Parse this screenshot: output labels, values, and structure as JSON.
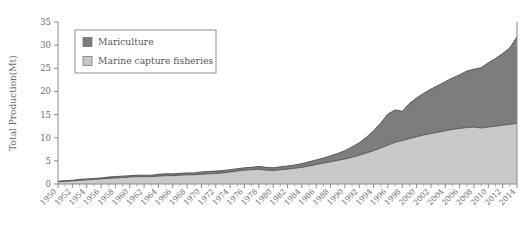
{
  "chart_data": {
    "type": "area",
    "stacked": true,
    "title": "",
    "xlabel": "",
    "ylabel": "Total Production(Mt)",
    "ylim": [
      0,
      35
    ],
    "yticks": [
      0,
      5,
      10,
      15,
      20,
      25,
      30,
      35
    ],
    "xlim": [
      1950,
      2014
    ],
    "grid": false,
    "legend_position": "upper-left",
    "x": [
      1950,
      1951,
      1952,
      1953,
      1954,
      1955,
      1956,
      1957,
      1958,
      1959,
      1960,
      1961,
      1962,
      1963,
      1964,
      1965,
      1966,
      1967,
      1968,
      1969,
      1970,
      1971,
      1972,
      1973,
      1974,
      1975,
      1976,
      1977,
      1978,
      1979,
      1980,
      1981,
      1982,
      1983,
      1984,
      1985,
      1986,
      1987,
      1988,
      1989,
      1990,
      1991,
      1992,
      1993,
      1994,
      1995,
      1996,
      1997,
      1998,
      1999,
      2000,
      2001,
      2002,
      2003,
      2004,
      2005,
      2006,
      2007,
      2008,
      2009,
      2010,
      2011,
      2012,
      2013,
      2014
    ],
    "xticks": [
      1950,
      1952,
      1954,
      1956,
      1958,
      1960,
      1962,
      1964,
      1966,
      1968,
      1970,
      1972,
      1974,
      1976,
      1978,
      1980,
      1982,
      1984,
      1986,
      1988,
      1990,
      1992,
      1994,
      1996,
      1998,
      2000,
      2002,
      2004,
      2006,
      2008,
      2010,
      2012,
      2014
    ],
    "series": [
      {
        "name": "Marine capture fisheries",
        "color": "#c9c9c9",
        "values": [
          0.5,
          0.6,
          0.7,
          0.8,
          0.9,
          1.0,
          1.1,
          1.2,
          1.3,
          1.4,
          1.5,
          1.6,
          1.6,
          1.6,
          1.7,
          1.8,
          1.8,
          1.9,
          2.0,
          2.0,
          2.1,
          2.2,
          2.3,
          2.4,
          2.6,
          2.8,
          3.0,
          3.1,
          3.2,
          3.0,
          2.9,
          3.1,
          3.2,
          3.4,
          3.6,
          3.9,
          4.2,
          4.5,
          4.8,
          5.1,
          5.4,
          5.8,
          6.2,
          6.7,
          7.2,
          7.8,
          8.4,
          9.0,
          9.4,
          9.8,
          10.2,
          10.6,
          10.9,
          11.2,
          11.5,
          11.8,
          12.0,
          12.2,
          12.3,
          12.1,
          12.3,
          12.5,
          12.7,
          12.9,
          13.1
        ]
      },
      {
        "name": "Mariculture",
        "color": "#7d7d7d",
        "values": [
          0.1,
          0.1,
          0.1,
          0.2,
          0.2,
          0.2,
          0.2,
          0.3,
          0.3,
          0.3,
          0.3,
          0.3,
          0.3,
          0.3,
          0.4,
          0.4,
          0.4,
          0.4,
          0.4,
          0.4,
          0.5,
          0.5,
          0.5,
          0.5,
          0.5,
          0.5,
          0.5,
          0.5,
          0.6,
          0.6,
          0.6,
          0.6,
          0.7,
          0.7,
          0.8,
          0.9,
          1.0,
          1.1,
          1.3,
          1.5,
          1.8,
          2.2,
          2.7,
          3.4,
          4.3,
          5.4,
          6.7,
          7.0,
          6.3,
          7.6,
          8.4,
          9.0,
          9.6,
          10.1,
          10.6,
          11.1,
          11.6,
          12.2,
          12.5,
          13.0,
          13.9,
          14.6,
          15.5,
          16.5,
          18.7
        ]
      }
    ],
    "legend": [
      {
        "label": "Mariculture",
        "color": "#7d7d7d"
      },
      {
        "label": "Marine capture fisheries",
        "color": "#c9c9c9"
      }
    ]
  }
}
